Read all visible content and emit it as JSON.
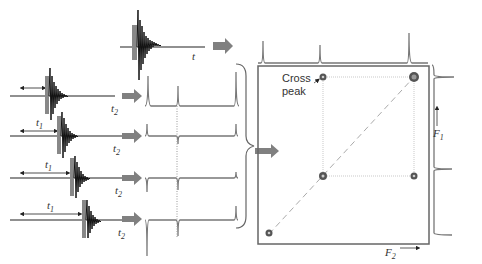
{
  "diagram": {
    "colors": {
      "fid": "#111111",
      "spectrum": "#777777",
      "arrow": "#808080",
      "frame": "#666666",
      "grid": "#bbbbbb",
      "diagonal": "#aaaaaa"
    },
    "top_fid": {
      "time_label": "t"
    },
    "fid_rows": [
      {
        "evolution_label": "",
        "detection_label": "t",
        "detection_sub": "2"
      },
      {
        "evolution_label": "t",
        "evolution_sub": "1",
        "detection_label": "t",
        "detection_sub": "2"
      },
      {
        "evolution_label": "t",
        "evolution_sub": "1",
        "detection_label": "t",
        "detection_sub": "2"
      },
      {
        "evolution_label": "t",
        "evolution_sub": "1",
        "detection_label": "t",
        "detection_sub": "2"
      }
    ],
    "plot": {
      "cross_peak_label_line1": "Cross",
      "cross_peak_label_line2": "peak",
      "f1_label": "F",
      "f1_sub": "1",
      "f2_label": "F",
      "f2_sub": "2"
    }
  }
}
